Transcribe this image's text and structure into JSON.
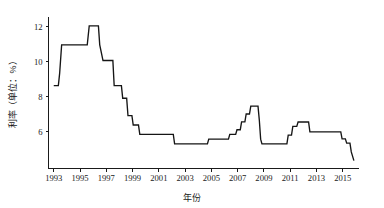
{
  "chart_data": {
    "type": "line",
    "title": "",
    "subtitle": "",
    "xlabel": "年份",
    "ylabel": "利率（单位：%）",
    "xlim": [
      1992.6,
      2016.2
    ],
    "ylim": [
      3.9,
      12.6
    ],
    "grid": false,
    "legend": null,
    "step_style": "post",
    "x_ticks": [
      "1993",
      "1995",
      "1997",
      "1999",
      "2001",
      "2003",
      "2005",
      "2007",
      "2009",
      "2011",
      "2013",
      "2015"
    ],
    "x_tick_values": [
      1993,
      1995,
      1997,
      1999,
      2001,
      2003,
      2005,
      2007,
      2009,
      2011,
      2013,
      2015
    ],
    "y_ticks": [
      "6",
      "8",
      "10",
      "12"
    ],
    "y_tick_values": [
      6,
      8,
      10,
      12
    ],
    "series": [
      {
        "name": "利率",
        "x": [
          1993.0,
          1993.35,
          1993.45,
          1993.6,
          1995.55,
          1995.7,
          1996.4,
          1996.5,
          1996.75,
          1997.5,
          1997.6,
          1998.15,
          1998.25,
          1998.55,
          1998.65,
          1998.95,
          1999.05,
          1999.45,
          1999.55,
          2002.1,
          2002.2,
          2004.7,
          2004.8,
          2006.3,
          2006.4,
          2006.85,
          2006.95,
          2007.2,
          2007.3,
          2007.55,
          2007.65,
          2007.9,
          2008.0,
          2008.55,
          2008.65,
          2008.75,
          2008.85,
          2010.75,
          2010.85,
          2011.1,
          2011.2,
          2011.5,
          2011.6,
          2012.4,
          2012.5,
          2014.85,
          2014.95,
          2015.2,
          2015.3,
          2015.55,
          2015.65,
          2015.85
        ],
        "values": [
          8.64,
          8.64,
          9.36,
          10.98,
          10.98,
          12.06,
          12.06,
          10.98,
          10.08,
          10.08,
          8.64,
          8.64,
          7.92,
          7.92,
          6.93,
          6.93,
          6.39,
          6.39,
          5.85,
          5.85,
          5.31,
          5.31,
          5.58,
          5.58,
          5.85,
          5.85,
          6.12,
          6.12,
          6.57,
          6.57,
          7.02,
          7.02,
          7.47,
          7.47,
          6.66,
          5.58,
          5.31,
          5.31,
          5.81,
          5.81,
          6.31,
          6.31,
          6.56,
          6.56,
          6.0,
          6.0,
          5.6,
          5.6,
          5.35,
          5.35,
          4.85,
          4.35
        ],
        "color": "#151515"
      }
    ],
    "annotations": []
  }
}
